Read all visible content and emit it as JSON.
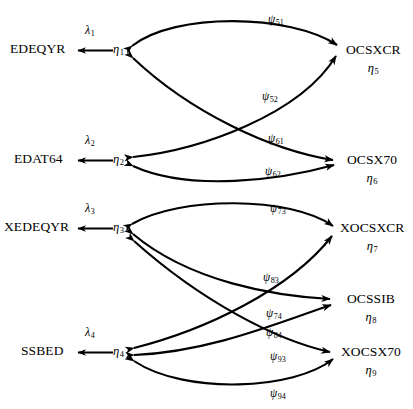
{
  "figure": {
    "type": "path-diagram",
    "title": "",
    "background": "#ffffff",
    "stroke_color": "#000000"
  },
  "left_nodes": [
    {
      "id": "eta1",
      "observed": "EDEQYR",
      "latent": "η",
      "sub": "1",
      "loading": "λ",
      "loading_sub": "1"
    },
    {
      "id": "eta2",
      "observed": "EDAT64",
      "latent": "η",
      "sub": "2",
      "loading": "λ",
      "loading_sub": "2"
    },
    {
      "id": "eta3",
      "observed": "XEDEQYR",
      "latent": "η",
      "sub": "3",
      "loading": "λ",
      "loading_sub": "3"
    },
    {
      "id": "eta4",
      "observed": "SSBED",
      "latent": "η",
      "sub": "4",
      "loading": "λ",
      "loading_sub": "4"
    }
  ],
  "right_nodes": [
    {
      "id": "eta5",
      "observed": "OCSXCR",
      "latent": "η",
      "sub": "5"
    },
    {
      "id": "eta6",
      "observed": "OCSX70",
      "latent": "η",
      "sub": "6"
    },
    {
      "id": "eta7",
      "observed": "XOCSXCR",
      "latent": "η",
      "sub": "7"
    },
    {
      "id": "eta8",
      "observed": "OCSSIB",
      "latent": "η",
      "sub": "8"
    },
    {
      "id": "eta9",
      "observed": "XOCSX70",
      "latent": "η",
      "sub": "9"
    }
  ],
  "psi_paths": [
    {
      "id": "psi51",
      "symbol": "ψ",
      "sub": "51",
      "from": "eta1",
      "to": "eta5"
    },
    {
      "id": "psi52",
      "symbol": "ψ",
      "sub": "52",
      "from": "eta2",
      "to": "eta5"
    },
    {
      "id": "psi61",
      "symbol": "ψ",
      "sub": "61",
      "from": "eta1",
      "to": "eta6"
    },
    {
      "id": "psi62",
      "symbol": "ψ",
      "sub": "62",
      "from": "eta2",
      "to": "eta6"
    },
    {
      "id": "psi73",
      "symbol": "ψ",
      "sub": "73",
      "from": "eta3",
      "to": "eta7"
    },
    {
      "id": "psi83",
      "symbol": "ψ",
      "sub": "83",
      "from": "eta3",
      "to": "eta8"
    },
    {
      "id": "psi74",
      "symbol": "ψ",
      "sub": "74",
      "from": "eta4",
      "to": "eta7"
    },
    {
      "id": "psi84",
      "symbol": "ψ",
      "sub": "84",
      "from": "eta4",
      "to": "eta8"
    },
    {
      "id": "psi93",
      "symbol": "ψ",
      "sub": "93",
      "from": "eta3",
      "to": "eta9"
    },
    {
      "id": "psi94",
      "symbol": "ψ",
      "sub": "94",
      "from": "eta4",
      "to": "eta9"
    }
  ]
}
